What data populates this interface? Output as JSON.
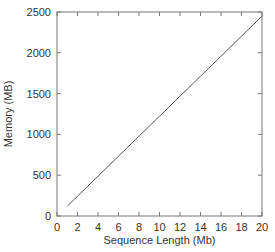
{
  "chart_data": {
    "type": "line",
    "title": "",
    "xlabel": "Sequence Length (Mb)",
    "ylabel": "Memory (MB)",
    "xlim": [
      0,
      20
    ],
    "ylim": [
      0,
      2500
    ],
    "xticks": [
      0,
      2,
      4,
      6,
      8,
      10,
      12,
      14,
      16,
      18,
      20
    ],
    "yticks": [
      0,
      500,
      1000,
      1500,
      2000,
      2500
    ],
    "grid": false,
    "legend": null,
    "series": [
      {
        "name": "Memory",
        "color": "#555555",
        "x": [
          1,
          2,
          4,
          6,
          8,
          10,
          12,
          14,
          16,
          18,
          20
        ],
        "y": [
          120,
          243,
          488,
          733,
          978,
          1223,
          1468,
          1713,
          1958,
          2204,
          2450
        ]
      }
    ]
  }
}
